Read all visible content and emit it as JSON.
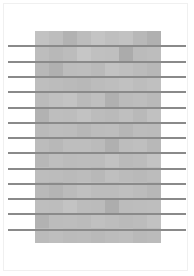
{
  "colors": {
    "background": "#ffffff",
    "page_border": "#f0f0f0",
    "line": "#8a8a8a"
  },
  "grid": {
    "columns": 9,
    "rows": 14,
    "shades": [
      [
        "#c2c2c2",
        "#bdbdbd",
        "#b2b2b2",
        "#bcbcbc",
        "#c4c4c4",
        "#bfbfbf",
        "#c2c2c2",
        "#b8b8b8",
        "#b0b0b0"
      ],
      [
        "#bdbdbd",
        "#b8b8b8",
        "#bcbcbc",
        "#c6c6c6",
        "#c0c0c0",
        "#bfbfbf",
        "#ababab",
        "#bbbbbb",
        "#bdbdbd"
      ],
      [
        "#b8b8b8",
        "#b0b0b0",
        "#bcbcbc",
        "#bdbdbd",
        "#b9b9b9",
        "#c2c2c2",
        "#bfbfbf",
        "#bbbbbb",
        "#b7b7b7"
      ],
      [
        "#bebebe",
        "#bcbcbc",
        "#bababa",
        "#b8b8b8",
        "#bcbcbc",
        "#bebebe",
        "#c1c1c1",
        "#bdbdbd",
        "#c0c0c0"
      ],
      [
        "#bbbbbb",
        "#c0c0c0",
        "#c3c3c3",
        "#bababa",
        "#bfbfbf",
        "#b0b0b0",
        "#bbbbbb",
        "#bdbdbd",
        "#b9b9b9"
      ],
      [
        "#b2b2b2",
        "#bebebe",
        "#bdbdbd",
        "#c2c2c2",
        "#bcbcbc",
        "#bababa",
        "#bfbfbf",
        "#b9b9b9",
        "#c1c1c1"
      ],
      [
        "#bababa",
        "#bdbdbd",
        "#bcbcbc",
        "#b7b7b7",
        "#bcbcbc",
        "#bdbdbd",
        "#b6b6b6",
        "#bcbcbc",
        "#bbbbbb"
      ],
      [
        "#bcbcbc",
        "#b8b8b8",
        "#bebebe",
        "#bebebe",
        "#bbbbbb",
        "#b0b0b0",
        "#bdbdbd",
        "#bfbfbf",
        "#b8b8b8"
      ],
      [
        "#b7b7b7",
        "#bebebe",
        "#bbbbbb",
        "#bcbcbc",
        "#bcbcbc",
        "#c2c2c2",
        "#bababa",
        "#bcbcbc",
        "#c3c3c3"
      ],
      [
        "#bdbdbd",
        "#bcbcbc",
        "#bababa",
        "#bcbcbc",
        "#b8b8b8",
        "#bfbfbf",
        "#bbbbbb",
        "#b9b9b9",
        "#bcbcbc"
      ],
      [
        "#b9b9b9",
        "#b4b4b4",
        "#bbbbbb",
        "#c0c0c0",
        "#bcbcbc",
        "#bcbcbc",
        "#bfbfbf",
        "#bcbcbc",
        "#b7b7b7"
      ],
      [
        "#bebebe",
        "#bdbdbd",
        "#c3c3c3",
        "#bcbcbc",
        "#bbbbbb",
        "#adadad",
        "#bcbcbc",
        "#bdbdbd",
        "#bebebe"
      ],
      [
        "#b2b2b2",
        "#bcbcbc",
        "#bdbdbd",
        "#bbbbbb",
        "#c0c0c0",
        "#bdbdbd",
        "#bababa",
        "#bcbcbc",
        "#c2c2c2"
      ],
      [
        "#bbbbbb",
        "#bebebe",
        "#bbbbbb",
        "#bcbcbc",
        "#b9b9b9",
        "#bcbcbc",
        "#bebebe",
        "#b9b9b9",
        "#bbbbbb"
      ]
    ]
  },
  "lines": {
    "y_positions": [
      45,
      61,
      76,
      91,
      107,
      122,
      137,
      152,
      168,
      183,
      198,
      213,
      229
    ]
  }
}
